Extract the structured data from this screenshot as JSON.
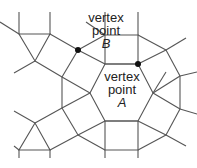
{
  "diagram": {
    "colors": {
      "edge": "#555555",
      "dot": "#111111",
      "text": "#222222"
    },
    "labels": {
      "b": {
        "line1": "vertex",
        "line2": "point",
        "line3": "B"
      },
      "a": {
        "line1": "vertex",
        "line2": "point",
        "line3": "A"
      }
    },
    "vertex_points": [
      {
        "name": "B",
        "x": 78,
        "y": 50
      },
      {
        "name": "A",
        "x": 138,
        "y": 64
      }
    ]
  }
}
